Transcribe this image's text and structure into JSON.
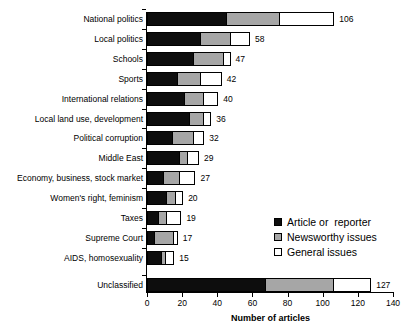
{
  "chart_data": {
    "type": "bar",
    "orientation": "horizontal",
    "stacked": true,
    "title": "",
    "xlabel": "Number of articles",
    "ylabel": "",
    "xlim": [
      0,
      140
    ],
    "xticks": [
      0,
      20,
      40,
      60,
      80,
      100,
      120,
      140
    ],
    "grid": false,
    "legend_position": "center-right",
    "categories": [
      "National politics",
      "Local politics",
      "Schools",
      "Sports",
      "International relations",
      "Local land use, development",
      "Political corruption",
      "Middle East",
      "Economy, business, stock market",
      "Women's right, feminism",
      "Taxes",
      "Supreme Court",
      "AIDS, homosexuality",
      "Unclassified"
    ],
    "series": [
      {
        "name": "Article or  reporter",
        "color": "#0d0d0d",
        "values": [
          45,
          30,
          26,
          17,
          21,
          24,
          14,
          18,
          9,
          11,
          6,
          4,
          8,
          67
        ]
      },
      {
        "name": "Newsworthy issues",
        "color": "#a6a6a6",
        "values": [
          30,
          17,
          17,
          13,
          11,
          8,
          12,
          5,
          9,
          5,
          5,
          11,
          2,
          39
        ]
      },
      {
        "name": "General issues",
        "color": "#ffffff",
        "values": [
          31,
          11,
          4,
          12,
          8,
          4,
          6,
          6,
          9,
          4,
          8,
          2,
          5,
          21
        ]
      }
    ],
    "totals": [
      106,
      58,
      47,
      42,
      40,
      36,
      32,
      29,
      27,
      20,
      19,
      17,
      15,
      127
    ]
  },
  "legend": {
    "items": [
      {
        "label": "Article or  reporter",
        "swatch": "black-square-icon"
      },
      {
        "label": "Newsworthy issues",
        "swatch": "gray-square-icon"
      },
      {
        "label": "General issues",
        "swatch": "white-square-icon"
      }
    ]
  }
}
